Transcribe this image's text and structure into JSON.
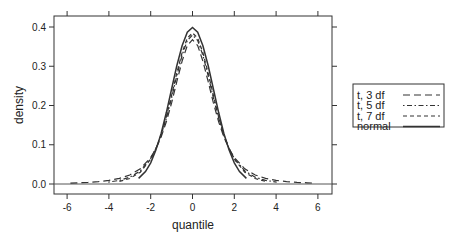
{
  "chart_data": {
    "type": "line",
    "title": "",
    "xlabel": "quantile",
    "ylabel": "density",
    "xlim": [
      -6.6,
      6.6
    ],
    "ylim": [
      -0.025,
      0.428
    ],
    "xticks": [
      -6,
      -4,
      -2,
      0,
      2,
      4,
      6
    ],
    "xtick_labels": [
      "-6",
      "-4",
      "-2",
      "0",
      "2",
      "4",
      "6"
    ],
    "yticks": [
      0.0,
      0.1,
      0.2,
      0.3,
      0.4
    ],
    "ytick_labels": [
      "0.0",
      "0.1",
      "0.2",
      "0.3",
      "0.4"
    ],
    "grid": false,
    "reference_line": {
      "y": 0.0,
      "style": "solid"
    },
    "legend": {
      "position": "right",
      "entries": [
        {
          "label": "t, 3 df",
          "style": "longdash"
        },
        {
          "label": "t, 5 df",
          "style": "dotdash"
        },
        {
          "label": "t, 7 df",
          "style": "dashed"
        },
        {
          "label": "normal",
          "style": "solid"
        }
      ]
    },
    "series": [
      {
        "name": "t, 3 df",
        "style": "longdash",
        "x": [
          -5.84,
          -5.5,
          -5,
          -4.5,
          -4,
          -3.5,
          -3,
          -2.5,
          -2,
          -1.75,
          -1.5,
          -1.25,
          -1,
          -0.75,
          -0.5,
          -0.25,
          0,
          0.25,
          0.5,
          0.75,
          1,
          1.25,
          1.5,
          1.75,
          2,
          2.5,
          3,
          3.5,
          4,
          4.5,
          5,
          5.5,
          5.84
        ],
        "y": [
          0.0024,
          0.003,
          0.0042,
          0.0061,
          0.0092,
          0.0142,
          0.023,
          0.0387,
          0.0675,
          0.09,
          0.12,
          0.1589,
          0.2067,
          0.2607,
          0.3132,
          0.3528,
          0.3676,
          0.3528,
          0.3132,
          0.2607,
          0.2067,
          0.1589,
          0.12,
          0.09,
          0.0675,
          0.0387,
          0.023,
          0.0142,
          0.0092,
          0.0061,
          0.0042,
          0.003,
          0.0024
        ]
      },
      {
        "name": "t, 5 df",
        "style": "dotdash",
        "x": [
          -4.03,
          -3.5,
          -3,
          -2.5,
          -2,
          -1.75,
          -1.5,
          -1.25,
          -1,
          -0.75,
          -0.5,
          -0.25,
          0,
          0.25,
          0.5,
          0.75,
          1,
          1.25,
          1.5,
          1.75,
          2,
          2.5,
          3,
          3.5,
          4.03
        ],
        "y": [
          0.0049,
          0.0092,
          0.0173,
          0.0333,
          0.0651,
          0.0905,
          0.1245,
          0.1679,
          0.2197,
          0.2757,
          0.3279,
          0.3657,
          0.3796,
          0.3657,
          0.3279,
          0.2757,
          0.2197,
          0.1679,
          0.1245,
          0.0905,
          0.0651,
          0.0333,
          0.0173,
          0.0092,
          0.0049
        ]
      },
      {
        "name": "t, 7 df",
        "style": "dashed",
        "x": [
          -3.5,
          -3,
          -2.5,
          -2,
          -1.75,
          -1.5,
          -1.25,
          -1,
          -0.75,
          -0.5,
          -0.25,
          0,
          0.25,
          0.5,
          0.75,
          1,
          1.25,
          1.5,
          1.75,
          2,
          2.5,
          3,
          3.5
        ],
        "y": [
          0.0067,
          0.0141,
          0.03,
          0.0631,
          0.0903,
          0.1259,
          0.1715,
          0.2257,
          0.2826,
          0.3346,
          0.3716,
          0.385,
          0.3716,
          0.3346,
          0.2826,
          0.2257,
          0.1715,
          0.1259,
          0.0903,
          0.0631,
          0.03,
          0.0141,
          0.0067
        ]
      },
      {
        "name": "normal",
        "style": "solid",
        "x": [
          -2.58,
          -2.25,
          -2,
          -1.75,
          -1.5,
          -1.25,
          -1,
          -0.75,
          -0.5,
          -0.25,
          0,
          0.25,
          0.5,
          0.75,
          1,
          1.25,
          1.5,
          1.75,
          2,
          2.25,
          2.58
        ],
        "y": [
          0.0143,
          0.0317,
          0.054,
          0.0863,
          0.1295,
          0.1826,
          0.242,
          0.3011,
          0.3521,
          0.3867,
          0.3989,
          0.3867,
          0.3521,
          0.3011,
          0.242,
          0.1826,
          0.1295,
          0.0863,
          0.054,
          0.0317,
          0.0143
        ]
      }
    ]
  }
}
